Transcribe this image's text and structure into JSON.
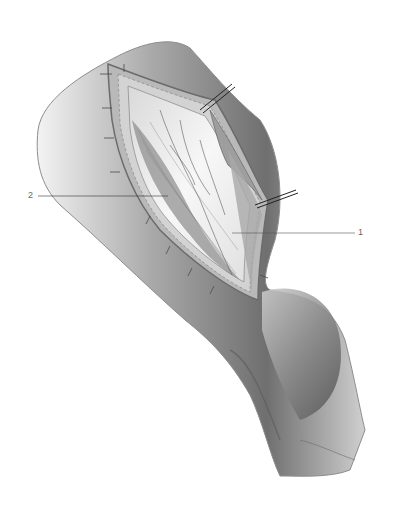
{
  "figure": {
    "labels": [
      {
        "id": "1",
        "text": "1"
      },
      {
        "id": "2",
        "text": "2"
      }
    ]
  }
}
